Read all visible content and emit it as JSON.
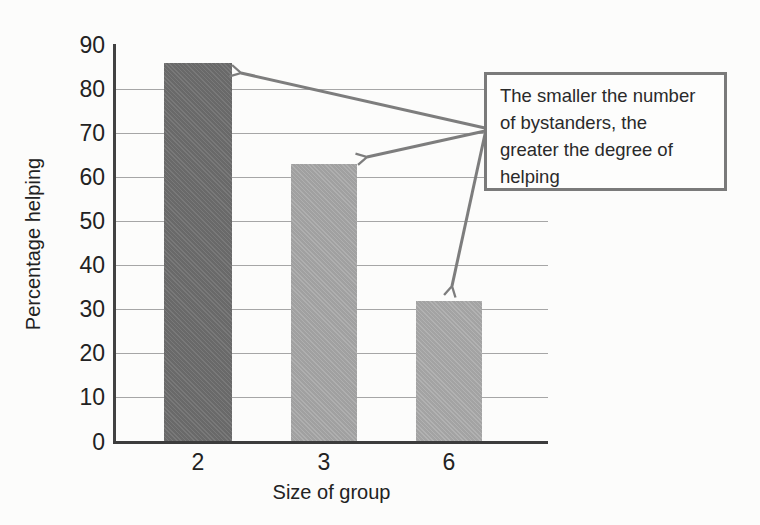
{
  "chart_data": {
    "type": "bar",
    "title": "",
    "categories": [
      "2",
      "3",
      "6"
    ],
    "values": [
      86,
      63,
      32
    ],
    "xlabel": "Size of group",
    "ylabel": "Percentage helping",
    "ylim": [
      0,
      90
    ],
    "yticks": [
      0,
      10,
      20,
      30,
      40,
      50,
      60,
      70,
      80,
      90
    ],
    "grid": "horizontal",
    "legend": "none",
    "bar_colors": [
      "#6f6f6f",
      "#a9a9a9",
      "#acacac"
    ],
    "annotation": {
      "text": "The smaller the number of bystanders, the greater the degree of helping",
      "lines": [
        "The smaller the number",
        "of bystanders, the",
        "greater the degree of",
        "helping"
      ],
      "arrows_point_to": [
        "top of bar 2",
        "top of bar 3",
        "top of bar 6"
      ]
    }
  },
  "colors": {
    "background": "#fcfcfb",
    "axis": "#3f3f3f",
    "gridline": "#a6a6a6",
    "text": "#262626",
    "arrow": "#7d7d7d",
    "annotation_border": "#7a7a7a",
    "bar_dark": "#6f6f6f",
    "bar_light": "#a9a9a9"
  }
}
